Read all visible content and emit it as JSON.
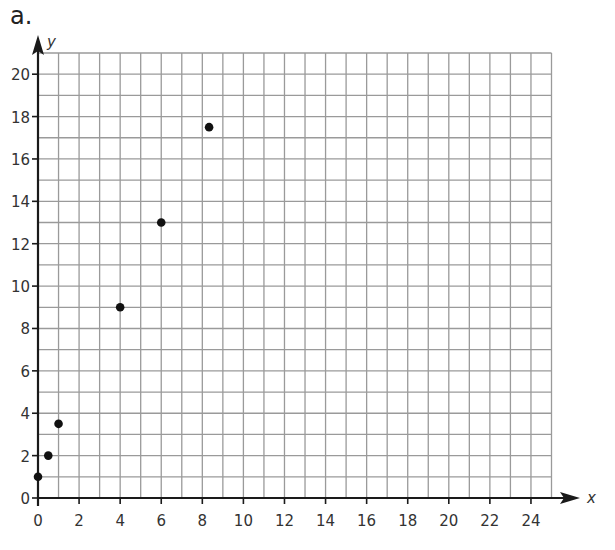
{
  "part_label": "a.",
  "chart_data": {
    "type": "scatter",
    "title": "",
    "xlabel": "x",
    "ylabel": "y",
    "xlim": [
      0,
      25
    ],
    "ylim": [
      0,
      21
    ],
    "x_ticks": [
      0,
      2,
      4,
      6,
      8,
      10,
      12,
      14,
      16,
      18,
      20,
      22,
      24
    ],
    "y_ticks": [
      0,
      2,
      4,
      6,
      8,
      10,
      12,
      14,
      16,
      18,
      20
    ],
    "grid": true,
    "grid_step": 1,
    "legend": null,
    "series": [
      {
        "name": "points",
        "x": [
          0,
          0.5,
          1,
          4,
          6,
          8.33
        ],
        "y": [
          1,
          2,
          3.5,
          9,
          13,
          17.5
        ]
      }
    ],
    "colors": {
      "grid": "#9a9a9a",
      "axis": "#1a1a1a",
      "point": "#111111",
      "text": "#333333"
    }
  }
}
